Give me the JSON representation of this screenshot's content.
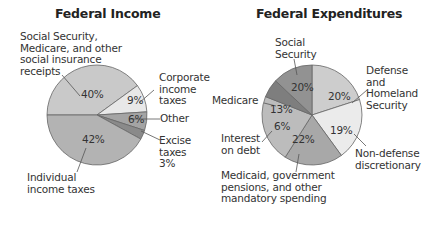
{
  "chart_data": [
    {
      "type": "pie",
      "title": "Federal Income",
      "center": [
        97,
        115
      ],
      "radius": 50,
      "start_angle_deg": 180,
      "direction": "clockwise",
      "slices": [
        {
          "label": "Social Security, Medicare, and other social insurance receipts",
          "value": 40,
          "color": "#c9c9c9",
          "pct_label": "40%"
        },
        {
          "label": "Corporate income taxes",
          "value": 9,
          "color": "#e8e8e8",
          "pct_label": "9%"
        },
        {
          "label": "Other",
          "value": 6,
          "color": "#a4a4a4",
          "pct_label": "6%"
        },
        {
          "label": "Excise taxes",
          "value": 3,
          "color": "#8a8a8a",
          "pct_label": "3%"
        },
        {
          "label": "Individual income taxes",
          "value": 42,
          "color": "#b3b3b3",
          "pct_label": "42%"
        }
      ]
    },
    {
      "type": "pie",
      "title": "Federal Expenditures",
      "center": [
        312,
        115
      ],
      "radius": 50,
      "start_angle_deg": 270,
      "direction": "clockwise",
      "slices": [
        {
          "label": "Social Security",
          "value": 20,
          "color": "#cdcdcd",
          "pct_label": "20%"
        },
        {
          "label": "Defense and Homeland Security",
          "value": 20,
          "color": "#ebebeb",
          "pct_label": "20%"
        },
        {
          "label": "Non-defense discretionary",
          "value": 19,
          "color": "#a8a8a8",
          "pct_label": "19%"
        },
        {
          "label": "Medicaid, government pensions, and other mandatory spending",
          "value": 22,
          "color": "#bcbcbc",
          "pct_label": "22%"
        },
        {
          "label": "Interest on debt",
          "value": 6,
          "color": "#7e7e7e",
          "pct_label": "6%"
        },
        {
          "label": "Medicare",
          "value": 13,
          "color": "#929292",
          "pct_label": "13%"
        }
      ]
    }
  ],
  "income": {
    "title": "Federal Income",
    "labels": {
      "social": [
        "Social Security,",
        "Medicare, and other",
        "social insurance",
        "receipts"
      ],
      "corporate": [
        "Corporate",
        "income",
        "taxes"
      ],
      "other": "Other",
      "excise": [
        "Excise",
        "taxes",
        "3%"
      ],
      "individual": [
        "Individual",
        "income taxes"
      ]
    },
    "pcts": {
      "social": "40%",
      "corporate": "9%",
      "other": "6%",
      "individual": "42%"
    }
  },
  "expenditures": {
    "title": "Federal Expenditures",
    "labels": {
      "social": [
        "Social",
        "Security"
      ],
      "defense": [
        "Defense",
        "and",
        "Homeland",
        "Security"
      ],
      "medicare": "Medicare",
      "interest": [
        "Interest",
        "on debt"
      ],
      "nondefense": [
        "Non-defense",
        "discretionary"
      ],
      "medicaid": [
        "Medicaid, government",
        "pensions, and other",
        "mandatory spending"
      ]
    },
    "pcts": {
      "social": "20%",
      "defense": "20%",
      "medicare": "13%",
      "interest": "6%",
      "nondefense": "19%",
      "medicaid": "22%"
    }
  }
}
